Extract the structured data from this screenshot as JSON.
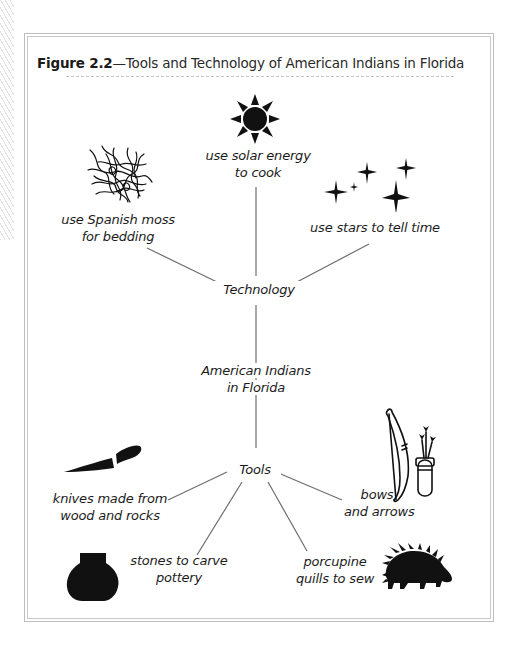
{
  "figure": {
    "number_label": "Figure 2.2",
    "title_text": "—Tools and Technology of American Indians in Florida"
  },
  "diagram": {
    "center": {
      "line1": "American Indians",
      "line2": "in Florida"
    },
    "technology": {
      "label": "Technology",
      "items": [
        {
          "icon": "sun-icon",
          "line1": "use solar energy",
          "line2": "to cook"
        },
        {
          "icon": "spanish-moss-icon",
          "line1": "use Spanish moss",
          "line2": "for bedding"
        },
        {
          "icon": "stars-icon",
          "line1": "use stars to tell time",
          "line2": ""
        }
      ]
    },
    "tools": {
      "label": "Tools",
      "items": [
        {
          "icon": "knife-icon",
          "line1": "knives made from",
          "line2": "wood and rocks"
        },
        {
          "icon": "pot-icon",
          "line1": "stones to carve",
          "line2": "pottery"
        },
        {
          "icon": "porcupine-icon",
          "line1": "porcupine",
          "line2": "quills to sew"
        },
        {
          "icon": "bow-and-quiver-icon",
          "line1": "bows",
          "line2": "and arrows"
        }
      ]
    }
  },
  "colors": {
    "ink": "#1c1c1c",
    "connector": "#6e6e6e",
    "frame": "#bdbdbd"
  }
}
